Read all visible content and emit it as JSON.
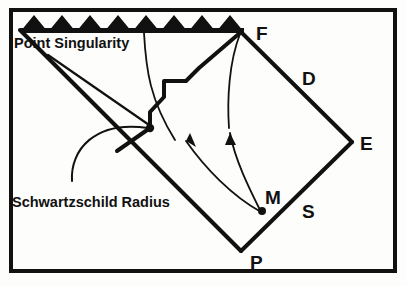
{
  "figure": {
    "type": "penrose-spacetime-diagram",
    "background_color": "#fdfdfb",
    "ink_color": "#111111",
    "border": {
      "name": "figure-frame",
      "x": 9,
      "y": 8,
      "width": 388,
      "height": 265,
      "stroke_width": 4
    },
    "singularity": {
      "name": "point-singularity-sawtooth",
      "peak_count": 8,
      "x_start": 20,
      "x_end": 244,
      "baseline_y": 32,
      "peak_y": 15
    },
    "vertices": [
      {
        "key": "F",
        "label": "F",
        "point_x": 241,
        "point_y": 32,
        "label_x": 256,
        "label_y": 40
      },
      {
        "key": "D",
        "label": "D",
        "point_x": 297,
        "point_y": 88,
        "label_x": 302,
        "label_y": 85
      },
      {
        "key": "E",
        "label": "E",
        "point_x": 352,
        "point_y": 142,
        "label_x": 360,
        "label_y": 150
      },
      {
        "key": "S",
        "label": "S",
        "point_x": 300,
        "point_y": 205,
        "label_x": 302,
        "label_y": 218
      },
      {
        "key": "M",
        "label": "M",
        "point_x": 262,
        "point_y": 211,
        "label_x": 265,
        "label_y": 204
      },
      {
        "key": "P",
        "label": "P",
        "point_x": 241,
        "point_y": 251,
        "label_x": 250,
        "label_y": 269
      }
    ],
    "captions": [
      {
        "key": "point-singularity",
        "text": "Point Singularity",
        "x": 14,
        "y": 48,
        "leader_from_x": 48,
        "leader_from_y": 55,
        "leader_to_x": 152,
        "leader_to_y": 127
      },
      {
        "key": "schwartzschild-radius",
        "text": "Schwartzschild Radius",
        "x": 12,
        "y": 207,
        "leader_from_x": 72,
        "leader_from_y": 181,
        "leader_to_x": 150,
        "leader_to_y": 128
      }
    ],
    "worldlines": [
      {
        "key": "infall-left",
        "from": "M",
        "arrow_direction": "up-left",
        "arrow_x": 191,
        "arrow_y": 136
      },
      {
        "key": "infall-right",
        "from": "M",
        "arrow_direction": "up",
        "arrow_x": 230,
        "arrow_y": 128
      }
    ],
    "horizon": {
      "name": "event-horizon-line",
      "from_x": 20,
      "from_y": 30,
      "to_x": 241,
      "to_y": 251
    },
    "interior_boundary": {
      "name": "collapsing-star-surface",
      "description": "staircase profile from horizon junction up to F"
    }
  }
}
